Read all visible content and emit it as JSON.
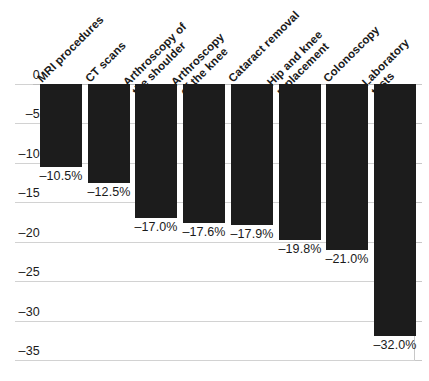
{
  "chart_data": {
    "type": "bar",
    "title": "",
    "subtitle": "",
    "xlabel": "",
    "ylabel": "",
    "orientation": "vertical",
    "grid": true,
    "legend": false,
    "ylim": [
      -35,
      0
    ],
    "ytick_step": 5,
    "ytick_labels": [
      "0",
      "–5",
      "–10",
      "–15",
      "–20",
      "–25",
      "–30",
      "–35"
    ],
    "ytick_values": [
      0,
      -5,
      -10,
      -15,
      -20,
      -25,
      -30,
      -35
    ],
    "categories": [
      "MRI procedures",
      "CT scans",
      "Arthroscopy of\nthe shoulder",
      "Arthroscopy\nof the knee",
      "Cataract removal",
      "Hip and knee\nreplacement",
      "Colonoscopy",
      "Laboratory\ntests"
    ],
    "values": [
      -10.5,
      -12.5,
      -17.0,
      -17.6,
      -17.9,
      -19.8,
      -21.0,
      -32.0
    ],
    "data_labels": [
      "–10.5%",
      "–12.5%",
      "–17.0%",
      "–17.6%",
      "–17.9%",
      "–19.8%",
      "–21.0%",
      "–32.0%"
    ],
    "bar_color": "#1c1c1c",
    "grid_color": "#d2d2d2",
    "axis_color": "#c8c8c8",
    "text_color": "#1a1a1a",
    "background_color": "#ffffff"
  }
}
